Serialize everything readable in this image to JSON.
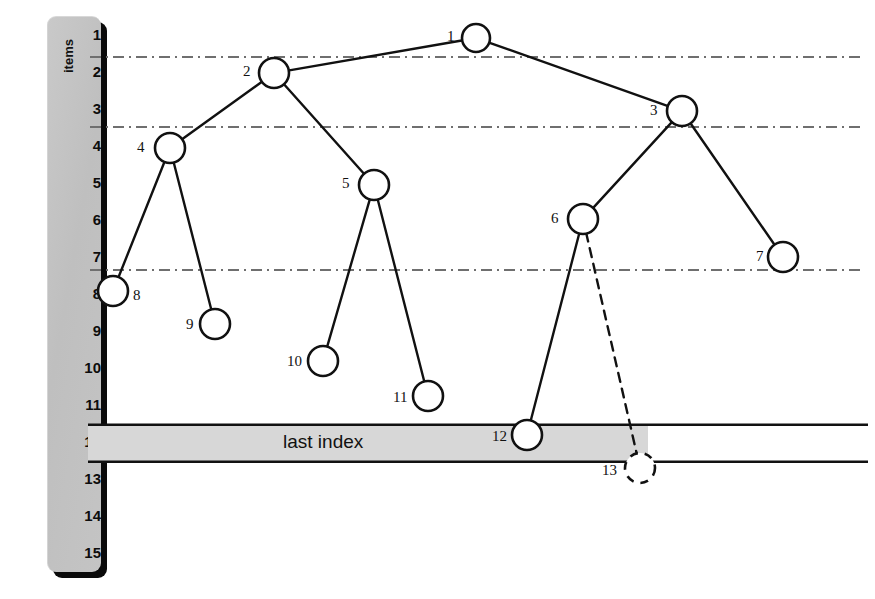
{
  "diagram": {
    "axis": {
      "label": "items",
      "ticks": [
        "1",
        "2",
        "3",
        "4",
        "5",
        "6",
        "7",
        "8",
        "9",
        "10",
        "11",
        "12",
        "13",
        "14",
        "15"
      ]
    },
    "last_index_band": {
      "label": "last index",
      "row": "12"
    },
    "colors": {
      "ruler_fill": "#c4c4c4",
      "ruler_shadow": "#0a0a0a",
      "band_fill": "#d7d7d7",
      "stroke": "#111111",
      "level_line": "#6f6f6f",
      "node_fill": "#ffffff"
    },
    "nodes": [
      {
        "id": "1",
        "label": "1",
        "cx": 476,
        "cy": 38,
        "r": 14,
        "style": "solid",
        "label_x": 447,
        "label_y": 29
      },
      {
        "id": "2",
        "label": "2",
        "cx": 274,
        "cy": 73,
        "r": 15,
        "style": "solid",
        "label_x": 243,
        "label_y": 64
      },
      {
        "id": "3",
        "label": "3",
        "cx": 682,
        "cy": 111,
        "r": 15,
        "style": "solid",
        "label_x": 650,
        "label_y": 103
      },
      {
        "id": "4",
        "label": "4",
        "cx": 170,
        "cy": 148,
        "r": 15,
        "style": "solid",
        "label_x": 137,
        "label_y": 140
      },
      {
        "id": "5",
        "label": "5",
        "cx": 374,
        "cy": 185,
        "r": 15,
        "style": "solid",
        "label_x": 342,
        "label_y": 176
      },
      {
        "id": "6",
        "label": "6",
        "cx": 583,
        "cy": 219,
        "r": 15,
        "style": "solid",
        "label_x": 551,
        "label_y": 211
      },
      {
        "id": "7",
        "label": "7",
        "cx": 783,
        "cy": 257,
        "r": 15,
        "style": "solid",
        "label_x": 756,
        "label_y": 249
      },
      {
        "id": "8",
        "label": "8",
        "cx": 113,
        "cy": 291,
        "r": 15,
        "style": "solid",
        "label_x": 133,
        "label_y": 288
      },
      {
        "id": "9",
        "label": "9",
        "cx": 215,
        "cy": 324,
        "r": 15,
        "style": "solid",
        "label_x": 186,
        "label_y": 317
      },
      {
        "id": "10",
        "label": "10",
        "cx": 323,
        "cy": 361,
        "r": 15,
        "style": "solid",
        "label_x": 287,
        "label_y": 354
      },
      {
        "id": "11",
        "label": "11",
        "cx": 428,
        "cy": 396,
        "r": 15,
        "style": "solid",
        "label_x": 393,
        "label_y": 390
      },
      {
        "id": "12",
        "label": "12",
        "cx": 527,
        "cy": 435,
        "r": 15,
        "style": "solid",
        "label_x": 492,
        "label_y": 429
      },
      {
        "id": "13",
        "label": "13",
        "cx": 640,
        "cy": 468,
        "r": 15,
        "style": "dashed",
        "label_x": 602,
        "label_y": 463
      }
    ],
    "edges": [
      {
        "from": "1",
        "to": "2",
        "style": "solid"
      },
      {
        "from": "1",
        "to": "3",
        "style": "solid"
      },
      {
        "from": "2",
        "to": "4",
        "style": "solid"
      },
      {
        "from": "2",
        "to": "5",
        "style": "solid"
      },
      {
        "from": "3",
        "to": "6",
        "style": "solid"
      },
      {
        "from": "3",
        "to": "7",
        "style": "solid"
      },
      {
        "from": "4",
        "to": "8",
        "style": "solid"
      },
      {
        "from": "4",
        "to": "9",
        "style": "solid"
      },
      {
        "from": "5",
        "to": "10",
        "style": "solid"
      },
      {
        "from": "5",
        "to": "11",
        "style": "solid"
      },
      {
        "from": "6",
        "to": "12",
        "style": "solid"
      },
      {
        "from": "6",
        "to": "13",
        "style": "dashed"
      }
    ],
    "level_lines": [
      {
        "y": 57,
        "x1": 90,
        "x2": 860
      },
      {
        "y": 127,
        "x1": 90,
        "x2": 860
      },
      {
        "y": 270,
        "x1": 90,
        "x2": 860
      }
    ]
  }
}
